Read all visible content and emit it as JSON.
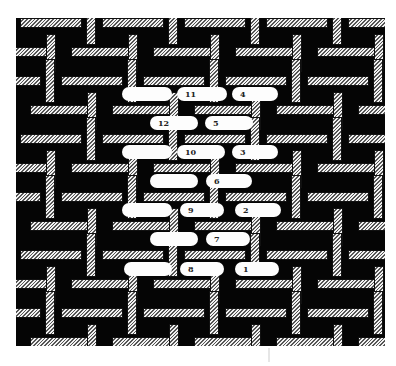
{
  "figure": {
    "colors": {
      "background": "#050505",
      "bar_light": "#f2f2f2",
      "bar_dark": "#555555",
      "pill": "#fdfdfd",
      "label": "#222222"
    },
    "lattice": {
      "cell_w": 82,
      "cell_h": 58,
      "h_bar_len": 62,
      "h_bar_thick": 10,
      "v_bar_len": 44,
      "v_bar_thick": 10
    },
    "pills": [
      {
        "label": "",
        "x": 122,
        "y": 87,
        "w": 50
      },
      {
        "label": "11",
        "x": 177,
        "y": 87,
        "w": 50
      },
      {
        "label": "4",
        "x": 232,
        "y": 87,
        "w": 46
      },
      {
        "label": "12",
        "x": 150,
        "y": 116,
        "w": 48
      },
      {
        "label": "5",
        "x": 205,
        "y": 116,
        "w": 48
      },
      {
        "label": "",
        "x": 122,
        "y": 145,
        "w": 50
      },
      {
        "label": "10",
        "x": 177,
        "y": 145,
        "w": 48
      },
      {
        "label": "3",
        "x": 232,
        "y": 145,
        "w": 46
      },
      {
        "label": "",
        "x": 150,
        "y": 174,
        "w": 48
      },
      {
        "label": "6",
        "x": 206,
        "y": 174,
        "w": 46
      },
      {
        "label": "",
        "x": 122,
        "y": 203,
        "w": 50
      },
      {
        "label": "9",
        "x": 180,
        "y": 203,
        "w": 44
      },
      {
        "label": "2",
        "x": 235,
        "y": 203,
        "w": 46
      },
      {
        "label": "",
        "x": 150,
        "y": 232,
        "w": 48
      },
      {
        "label": "7",
        "x": 206,
        "y": 232,
        "w": 44
      },
      {
        "label": "",
        "x": 124,
        "y": 262,
        "w": 48
      },
      {
        "label": "8",
        "x": 180,
        "y": 262,
        "w": 44
      },
      {
        "label": "1",
        "x": 235,
        "y": 262,
        "w": 44
      }
    ]
  }
}
